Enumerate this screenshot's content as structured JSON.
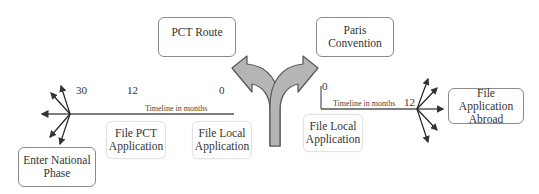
{
  "diagram": {
    "pct_route": {
      "label": "PCT Route"
    },
    "paris_convention": {
      "line1": "Paris",
      "line2": "Convention"
    },
    "left_timeline": {
      "label": "Timeline in months",
      "ticks": [
        "30",
        "12",
        "0"
      ],
      "boxes": {
        "enter_national": {
          "line1": "Enter National",
          "line2": "Phase"
        },
        "file_pct": {
          "line1": "File PCT",
          "line2": "Application"
        },
        "file_local": {
          "line1": "File Local",
          "line2": "Application"
        }
      }
    },
    "right_timeline": {
      "label": "Timeline in months",
      "ticks": [
        "0",
        "12"
      ],
      "boxes": {
        "file_local": {
          "line1": "File Local",
          "line2": "Application"
        },
        "file_abroad": {
          "line1": "File Application",
          "line2": "Abroad"
        }
      }
    },
    "colors": {
      "arrow_fill": "#b5b5b5",
      "arrow_stroke": "#555555",
      "line": "#555555",
      "box_border": "#8a8a8a"
    }
  }
}
